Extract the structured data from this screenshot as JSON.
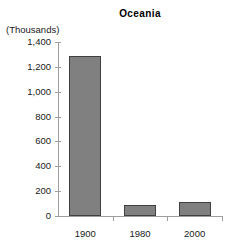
{
  "chart_data": {
    "type": "bar",
    "title": "Oceania",
    "xlabel": "",
    "ylabel": "(Thousands)",
    "categories": [
      "1900",
      "1980",
      "2000"
    ],
    "values": [
      1290,
      90,
      115
    ],
    "ylim": [
      0,
      1400
    ],
    "ytick_values": [
      0,
      200,
      400,
      600,
      800,
      1000,
      1200,
      1400
    ],
    "ytick_labels": [
      "0",
      "200",
      "400",
      "600",
      "800",
      "1,000",
      "1,200",
      "1,400"
    ],
    "grid": false,
    "legend": null,
    "series": [
      {
        "name": "Oceania",
        "values": [
          1290,
          90,
          115
        ]
      }
    ]
  },
  "colors": {
    "bar_fill": "#808080",
    "bar_border": "#404040",
    "axis_line": "#9e9e9e",
    "text": "#1a1a1a",
    "background": "#ffffff"
  }
}
